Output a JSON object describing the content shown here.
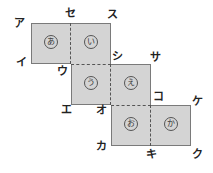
{
  "diagram": {
    "type": "cube-net",
    "fill_color": "#d4d4d4",
    "edge_color": "#7a7a7a",
    "faces": [
      {
        "label": "あ",
        "col": 0,
        "row": 0
      },
      {
        "label": "い",
        "col": 1,
        "row": 0
      },
      {
        "label": "う",
        "col": 1,
        "row": 1
      },
      {
        "label": "え",
        "col": 2,
        "row": 1
      },
      {
        "label": "お",
        "col": 2,
        "row": 2
      },
      {
        "label": "か",
        "col": 3,
        "row": 2
      }
    ],
    "vertices": {
      "a": "ア",
      "se": "セ",
      "su": "ス",
      "i": "イ",
      "u": "ウ",
      "shi": "シ",
      "sa": "サ",
      "e": "エ",
      "o": "オ",
      "ko": "コ",
      "ke": "ケ",
      "ka": "カ",
      "ki": "キ",
      "ku": "ク"
    }
  }
}
